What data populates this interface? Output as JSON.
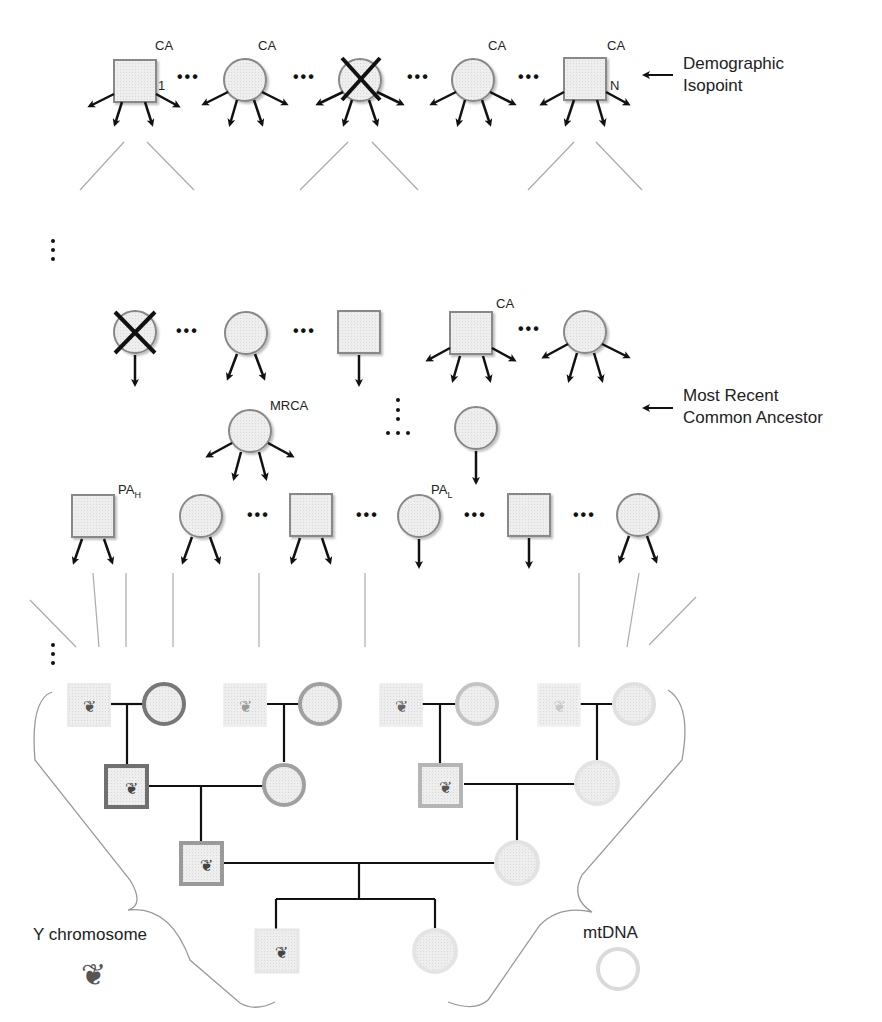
{
  "labels": {
    "demographic_isopoint_line1": "Demographic",
    "demographic_isopoint_line2": "Isopoint",
    "mrca_line1": "Most Recent",
    "mrca_line2": "Common Ancestor",
    "ca": "CA",
    "one": "1",
    "n": "N",
    "mrca": "MRCA",
    "pa_h": "PA",
    "pa_h_sub": "H",
    "pa_l": "PA",
    "pa_l_sub": "L",
    "y_chromosome": "Y chromosome",
    "mtdna": "mtDNA",
    "ellipsis": "•••"
  },
  "colors": {
    "node_fill": "#ebebeb",
    "node_stroke": "#8a8a8a",
    "arrow": "#111111",
    "guide_line": "#aaaaaa",
    "pedigree_dark": "#777777",
    "pedigree_mid": "#a3a3a3",
    "pedigree_light": "#d0d0d0",
    "pedigree_faint": "#e2e2e2",
    "chromosome": "#555555"
  },
  "rows": {
    "top": {
      "nodes": [
        "square",
        "circle",
        "circle-crossed",
        "circle",
        "square"
      ],
      "labels": [
        "CA",
        "CA",
        "",
        "CA",
        "CA"
      ]
    },
    "middle": {
      "nodes": [
        "circle-crossed",
        "circle",
        "square",
        "square",
        "circle"
      ],
      "labels": [
        "",
        "",
        "",
        "CA",
        ""
      ]
    },
    "ancestor": {
      "nodes": [
        "circle",
        "circle"
      ],
      "labels": [
        "MRCA",
        ""
      ]
    },
    "pa": {
      "nodes": [
        "square",
        "circle",
        "square",
        "circle",
        "square",
        "circle"
      ],
      "labels": [
        "PA_H",
        "",
        "",
        "PA_L",
        "",
        ""
      ]
    }
  }
}
